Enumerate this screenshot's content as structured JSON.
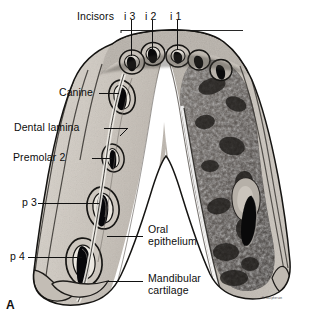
{
  "figure": {
    "panel_label": "A",
    "credit": "H. Macpherson",
    "palette": {
      "background": "#ffffff",
      "ink": "#0d0d0d",
      "leader": "#1a1a1a",
      "bone_light": "#cfcac2",
      "bone_mid": "#a9a29a",
      "bone_shadow": "#6d6761",
      "cartilage_dark": "#55504c",
      "cartilage_mottle": "#2c2a28",
      "tooth_cavity": "#0a0a0a",
      "epithelium_white": "#ffffff"
    }
  },
  "labels": {
    "incisors": {
      "text": "Incisors",
      "teeth": [
        {
          "id": "i3",
          "text": "i 3"
        },
        {
          "id": "i2",
          "text": "i 2"
        },
        {
          "id": "i1",
          "text": "i 1"
        }
      ]
    },
    "canine": "Canine",
    "dental_lamina": "Dental lamina",
    "premolar_2": "Premolar 2",
    "p3": "p 3",
    "p4": "p 4",
    "oral_epithelium_line1": "Oral",
    "oral_epithelium_line2": "epithelium",
    "mandibular_cartilage_line1": "Mandibular",
    "mandibular_cartilage_line2": "cartilage"
  },
  "structures": [
    {
      "name": "incisor-tooth-germ-i1",
      "label": "i 1"
    },
    {
      "name": "incisor-tooth-germ-i2",
      "label": "i 2"
    },
    {
      "name": "incisor-tooth-germ-i3",
      "label": "i 3"
    },
    {
      "name": "canine-tooth-germ",
      "label": "Canine"
    },
    {
      "name": "dental-lamina",
      "label": "Dental lamina"
    },
    {
      "name": "premolar-2-tooth-germ",
      "label": "Premolar 2"
    },
    {
      "name": "premolar-3-tooth-germ",
      "label": "p 3"
    },
    {
      "name": "premolar-4-tooth-germ",
      "label": "p 4"
    },
    {
      "name": "oral-epithelium",
      "label": "Oral epithelium"
    },
    {
      "name": "mandibular-cartilage",
      "label": "Mandibular cartilage"
    }
  ]
}
